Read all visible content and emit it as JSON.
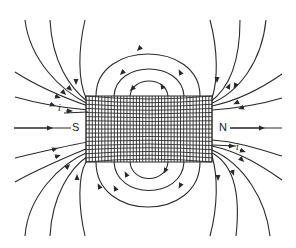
{
  "figure": {
    "title": "",
    "colors": {
      "background": "#ffffff",
      "ink": "#2a2a2a"
    },
    "poles": {
      "south": "S",
      "north": "N"
    },
    "current_labels": {
      "entry": "i",
      "exit": "i"
    },
    "solenoid": {
      "x": 86,
      "y": 96,
      "width": 126,
      "height": 66,
      "turns": 40
    }
  }
}
